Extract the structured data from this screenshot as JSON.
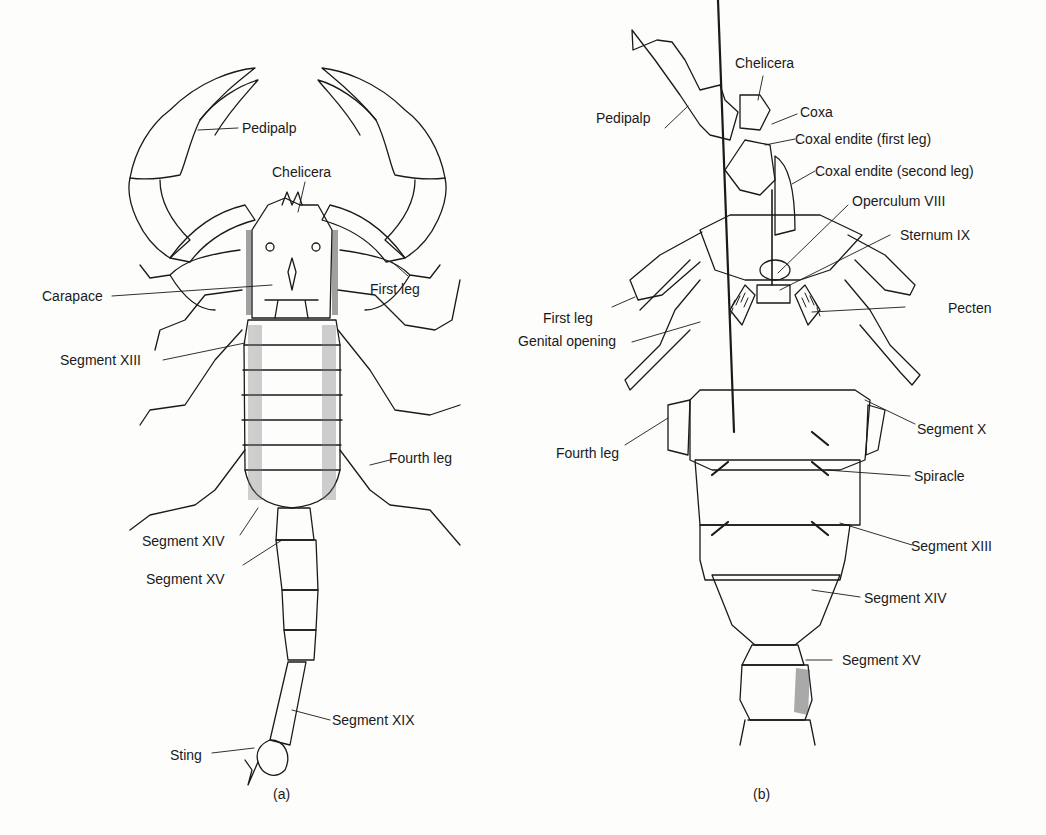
{
  "figure": {
    "panels": [
      {
        "id": "a",
        "caption": "(a)",
        "view": "dorsal",
        "labels": [
          {
            "key": "pedipalp",
            "text": "Pedipalp"
          },
          {
            "key": "chelicera",
            "text": "Chelicera"
          },
          {
            "key": "carapace",
            "text": "Carapace"
          },
          {
            "key": "first_leg",
            "text": "First leg"
          },
          {
            "key": "segment_xiii",
            "text": "Segment XIII"
          },
          {
            "key": "fourth_leg",
            "text": "Fourth leg"
          },
          {
            "key": "segment_xiv",
            "text": "Segment XIV"
          },
          {
            "key": "segment_xv",
            "text": "Segment XV"
          },
          {
            "key": "segment_xix",
            "text": "Segment XIX"
          },
          {
            "key": "sting",
            "text": "Sting"
          }
        ]
      },
      {
        "id": "b",
        "caption": "(b)",
        "view": "ventral",
        "labels": [
          {
            "key": "chelicera",
            "text": "Chelicera"
          },
          {
            "key": "pedipalp",
            "text": "Pedipalp"
          },
          {
            "key": "coxa",
            "text": "Coxa"
          },
          {
            "key": "coxal_endite_first",
            "text": "Coxal endite (first leg)"
          },
          {
            "key": "coxal_endite_second",
            "text": "Coxal endite (second leg)"
          },
          {
            "key": "operculum_viii",
            "text": "Operculum VIII"
          },
          {
            "key": "sternum_ix",
            "text": "Sternum IX"
          },
          {
            "key": "first_leg",
            "text": "First leg"
          },
          {
            "key": "pecten",
            "text": "Pecten"
          },
          {
            "key": "genital_opening",
            "text": "Genital opening"
          },
          {
            "key": "segment_x",
            "text": "Segment X"
          },
          {
            "key": "fourth_leg",
            "text": "Fourth leg"
          },
          {
            "key": "spiracle",
            "text": "Spiracle"
          },
          {
            "key": "segment_xiii",
            "text": "Segment XIII"
          },
          {
            "key": "segment_xiv",
            "text": "Segment XIV"
          },
          {
            "key": "segment_xv",
            "text": "Segment XV"
          }
        ]
      }
    ]
  }
}
